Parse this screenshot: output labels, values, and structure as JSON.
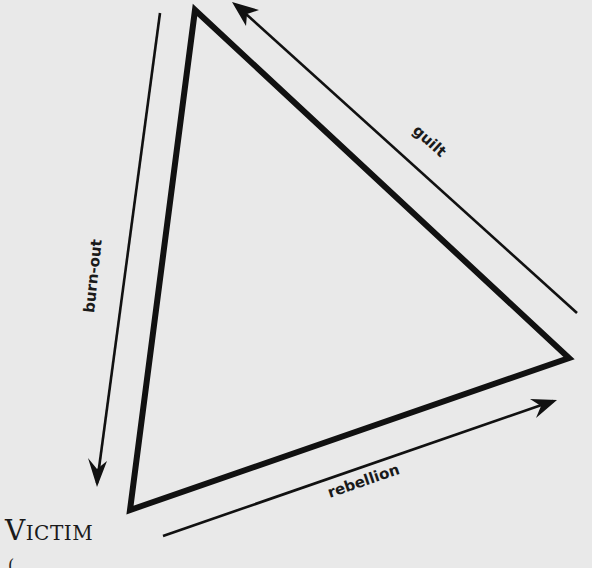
{
  "diagram": {
    "type": "triangle",
    "background_color": "#e9e9e9",
    "stroke_color": "#111111",
    "vertices": {
      "top": [
        195,
        10
      ],
      "right": [
        569,
        358
      ],
      "bottom_left": [
        130,
        510
      ]
    },
    "nodes": [
      {
        "id": "victim",
        "label": "Victim",
        "position": "bottom-left"
      }
    ],
    "edges": [
      {
        "id": "burn-out",
        "label": "burn-out",
        "from": "top",
        "to": "bottom_left",
        "side": "left"
      },
      {
        "id": "guilt",
        "label": "guilt",
        "from": "right",
        "to": "top",
        "side": "upper-right"
      },
      {
        "id": "rebellion",
        "label": "rebellion",
        "from": "bottom_left",
        "to": "right",
        "side": "bottom"
      }
    ]
  },
  "labels": {
    "victim": "Victim",
    "guilt": "guilt",
    "burnout": "burn-out",
    "rebellion": "rebellion",
    "partial_text": "(..."
  }
}
